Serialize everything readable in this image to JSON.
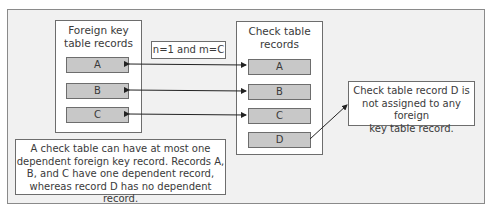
{
  "diagram": {
    "foreign_panel": {
      "title_line1": "Foreign key",
      "title_line2": "table records",
      "records": [
        "A",
        "B",
        "C"
      ]
    },
    "check_panel": {
      "title_line1": "Check table",
      "title_line2": "records",
      "records": [
        "A",
        "B",
        "C",
        "D"
      ]
    },
    "cardinality_label": "n=1 and m=C",
    "note_right": {
      "line1": "Check table record D is",
      "line2": "not assigned to any foreign",
      "line3": "key table record."
    },
    "note_bottom": {
      "line1": "A check table can have at most one",
      "line2": "dependent foreign key record. Records A,",
      "line3": "B, and C have one dependent record,",
      "line4": "whereas record D has no dependent record."
    },
    "colors": {
      "frame_bg": "#f1f1f1",
      "record_fill": "#c8c8c8",
      "border": "#6d6d6d"
    }
  }
}
